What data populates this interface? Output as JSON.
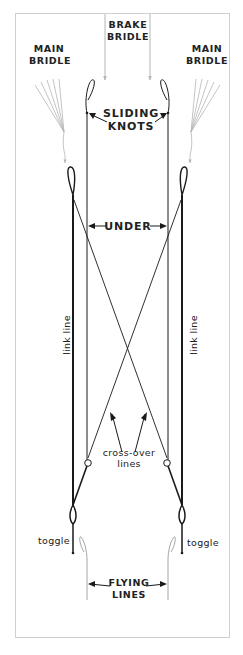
{
  "diagram": {
    "labels": {
      "brake_bridle_1": "BRAKE",
      "brake_bridle_2": "BRIDLE",
      "main_bridle_left_1": "MAIN",
      "main_bridle_left_2": "BRIDLE",
      "main_bridle_right_1": "MAIN",
      "main_bridle_right_2": "BRIDLE",
      "sliding_knots_1": "SLIDING",
      "sliding_knots_2": "KNOTS",
      "under": "UNDER",
      "link_line_left": "link line",
      "link_line_right": "link line",
      "cross_over_1": "cross-over",
      "cross_over_2": "lines",
      "toggle_left": "toggle",
      "toggle_right": "toggle",
      "flying_lines_1": "FLYING",
      "flying_lines_2": "LINES"
    },
    "colors": {
      "line": "#1a1a1a",
      "bridle": "#b5b5b5",
      "frame": "#cfcfcf",
      "text": "#222222"
    }
  }
}
